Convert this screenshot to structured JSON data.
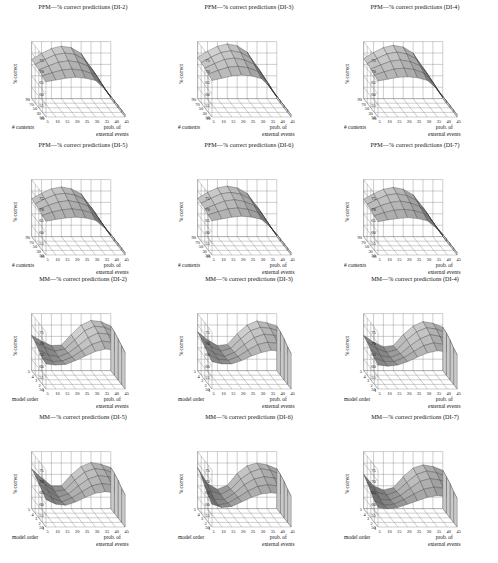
{
  "figure": {
    "kind": "3d-surface-grid",
    "rows": 4,
    "cols": 3,
    "background": "#ffffff",
    "ink": "#111111"
  },
  "axes_common": {
    "zlabel": "% correct",
    "xlabel_line1": "prob. of",
    "xlabel_line2": "external events",
    "z_ticks": [
      50,
      55,
      60,
      65,
      70,
      75
    ],
    "z_min": 50,
    "z_max": 75,
    "x_ticks": [
      5,
      10,
      15,
      20,
      25,
      30,
      35,
      40,
      45
    ],
    "pfm_depth_label": "# contexts",
    "pfm_depth_ticks": [
      90,
      70,
      50,
      30,
      10
    ],
    "mm_depth_label": "model order",
    "mm_depth_ticks": [
      5,
      4,
      3,
      2,
      1
    ]
  },
  "chart_data": [
    {
      "id": "pfm-di2",
      "type": "surface",
      "title": "PFM—% correct predictions (DI-2)",
      "model": "PFM",
      "dataset": "DI-2",
      "xlabel": "prob. of external events",
      "ylabel": "# contexts",
      "zlabel": "% correct",
      "x": [
        5,
        10,
        15,
        20,
        25,
        30,
        35,
        40,
        45
      ],
      "y": [
        10,
        30,
        50,
        70,
        90
      ],
      "zlim": [
        50,
        75
      ],
      "z": [
        [
          65.5,
          66.2,
          67.0,
          67.4,
          67.0,
          66.0,
          62.0,
          56.0,
          51.0
        ],
        [
          66.0,
          67.4,
          68.6,
          69.0,
          68.4,
          67.0,
          62.5,
          56.0,
          51.0
        ],
        [
          66.6,
          68.4,
          70.0,
          70.6,
          70.0,
          68.2,
          63.0,
          56.2,
          51.0
        ],
        [
          67.0,
          69.2,
          71.2,
          72.0,
          71.4,
          69.0,
          63.4,
          56.4,
          51.0
        ],
        [
          67.2,
          69.8,
          72.0,
          73.0,
          72.4,
          69.8,
          63.6,
          56.4,
          51.0
        ]
      ]
    },
    {
      "id": "pfm-di3",
      "type": "surface",
      "title": "PFM—% correct predictions (DI-3)",
      "model": "PFM",
      "dataset": "DI-3",
      "xlabel": "prob. of external events",
      "ylabel": "# contexts",
      "zlabel": "% correct",
      "x": [
        5,
        10,
        15,
        20,
        25,
        30,
        35,
        40,
        45
      ],
      "y": [
        10,
        30,
        50,
        70,
        90
      ],
      "zlim": [
        50,
        75
      ],
      "z": [
        [
          66.0,
          67.0,
          68.0,
          68.4,
          68.0,
          66.8,
          62.6,
          56.2,
          51.0
        ],
        [
          66.8,
          68.4,
          69.8,
          70.2,
          69.6,
          68.0,
          63.0,
          56.2,
          51.0
        ],
        [
          67.4,
          69.4,
          71.2,
          71.8,
          71.0,
          69.0,
          63.4,
          56.4,
          51.0
        ],
        [
          67.8,
          70.2,
          72.2,
          73.0,
          72.2,
          69.8,
          63.8,
          56.6,
          51.0
        ],
        [
          68.0,
          70.8,
          73.0,
          74.0,
          73.2,
          70.4,
          64.0,
          56.6,
          51.0
        ]
      ]
    },
    {
      "id": "pfm-di4",
      "type": "surface",
      "title": "PFM—% correct predictions (DI-4)",
      "model": "PFM",
      "dataset": "DI-4",
      "xlabel": "prob. of external events",
      "ylabel": "# contexts",
      "zlabel": "% correct",
      "x": [
        5,
        10,
        15,
        20,
        25,
        30,
        35,
        40,
        45
      ],
      "y": [
        10,
        30,
        50,
        70,
        90
      ],
      "zlim": [
        50,
        75
      ],
      "z": [
        [
          65.8,
          66.6,
          67.4,
          67.6,
          67.2,
          66.0,
          62.2,
          56.0,
          51.0
        ],
        [
          66.4,
          67.8,
          69.0,
          69.4,
          68.8,
          67.2,
          62.6,
          56.0,
          51.0
        ],
        [
          67.0,
          68.8,
          70.4,
          71.0,
          70.2,
          68.4,
          63.0,
          56.2,
          51.0
        ],
        [
          67.4,
          69.6,
          71.6,
          72.4,
          71.6,
          69.2,
          63.4,
          56.4,
          51.0
        ],
        [
          67.6,
          70.2,
          72.4,
          73.4,
          72.6,
          70.0,
          63.6,
          56.4,
          51.0
        ]
      ]
    },
    {
      "id": "pfm-di5",
      "type": "surface",
      "title": "PFM—% correct predictions (DI-5)",
      "model": "PFM",
      "dataset": "DI-5",
      "xlabel": "prob. of external events",
      "ylabel": "# contexts",
      "zlabel": "% correct",
      "x": [
        5,
        10,
        15,
        20,
        25,
        30,
        35,
        40,
        45
      ],
      "y": [
        10,
        30,
        50,
        70,
        90
      ],
      "zlim": [
        50,
        75
      ],
      "z": [
        [
          64.8,
          65.6,
          66.2,
          66.6,
          66.2,
          65.2,
          61.6,
          55.8,
          51.0
        ],
        [
          65.4,
          66.8,
          67.8,
          68.2,
          67.6,
          66.4,
          62.0,
          56.0,
          51.0
        ],
        [
          66.0,
          67.8,
          69.2,
          69.8,
          69.0,
          67.4,
          62.4,
          56.0,
          51.0
        ],
        [
          66.4,
          68.6,
          70.4,
          71.0,
          70.2,
          68.2,
          62.8,
          56.2,
          51.0
        ],
        [
          66.6,
          69.0,
          71.0,
          71.8,
          71.0,
          68.8,
          63.0,
          56.2,
          51.0
        ]
      ]
    },
    {
      "id": "pfm-di6",
      "type": "surface",
      "title": "PFM—% correct predictions (DI-6)",
      "model": "PFM",
      "dataset": "DI-6",
      "xlabel": "prob. of external events",
      "ylabel": "# contexts",
      "zlabel": "% correct",
      "x": [
        5,
        10,
        15,
        20,
        25,
        30,
        35,
        40,
        45
      ],
      "y": [
        10,
        30,
        50,
        70,
        90
      ],
      "zlim": [
        50,
        75
      ],
      "z": [
        [
          65.0,
          65.8,
          66.6,
          67.0,
          66.6,
          65.6,
          61.8,
          55.8,
          51.0
        ],
        [
          65.6,
          67.0,
          68.2,
          68.6,
          68.0,
          66.6,
          62.2,
          56.0,
          51.0
        ],
        [
          66.2,
          68.0,
          69.6,
          70.2,
          69.4,
          67.6,
          62.6,
          56.0,
          51.0
        ],
        [
          66.6,
          68.8,
          70.8,
          71.4,
          70.6,
          68.4,
          63.0,
          56.2,
          51.0
        ],
        [
          66.8,
          69.4,
          71.4,
          72.2,
          71.4,
          69.0,
          63.2,
          56.2,
          51.0
        ]
      ]
    },
    {
      "id": "pfm-di7",
      "type": "surface",
      "title": "PFM—% correct predictions (DI-7)",
      "model": "PFM",
      "dataset": "DI-7",
      "xlabel": "prob. of external events",
      "ylabel": "# contexts",
      "zlabel": "% correct",
      "x": [
        5,
        10,
        15,
        20,
        25,
        30,
        35,
        40,
        45
      ],
      "y": [
        10,
        30,
        50,
        70,
        90
      ],
      "zlim": [
        50,
        75
      ],
      "z": [
        [
          64.6,
          65.4,
          66.0,
          66.4,
          66.0,
          65.0,
          61.4,
          55.6,
          51.0
        ],
        [
          65.2,
          66.6,
          67.6,
          68.0,
          67.4,
          66.2,
          61.8,
          55.8,
          51.0
        ],
        [
          65.8,
          67.6,
          69.0,
          69.6,
          68.8,
          67.0,
          62.2,
          56.0,
          51.0
        ],
        [
          66.2,
          68.4,
          70.2,
          70.8,
          70.0,
          67.8,
          62.6,
          56.0,
          51.0
        ],
        [
          66.4,
          68.8,
          70.8,
          71.6,
          70.8,
          68.4,
          62.8,
          56.2,
          51.0
        ]
      ]
    },
    {
      "id": "mm-di2",
      "type": "surface",
      "title": "MM—% correct predictions (DI-2)",
      "model": "MM",
      "dataset": "DI-2",
      "xlabel": "prob. of external events",
      "ylabel": "model order",
      "zlabel": "% correct",
      "x": [
        5,
        10,
        15,
        20,
        25,
        30,
        35,
        40,
        45
      ],
      "y": [
        1,
        2,
        3,
        4,
        5
      ],
      "zlim": [
        50,
        75
      ],
      "z": [
        [
          61.0,
          60.5,
          60.8,
          62.5,
          64.5,
          66.5,
          67.5,
          67.0,
          66.0
        ],
        [
          61.5,
          60.0,
          60.2,
          62.0,
          64.8,
          67.5,
          69.0,
          68.5,
          67.0
        ],
        [
          63.0,
          60.8,
          60.0,
          61.8,
          65.0,
          68.5,
          70.5,
          70.0,
          68.0
        ],
        [
          64.5,
          62.0,
          60.5,
          61.5,
          65.5,
          69.5,
          71.5,
          71.0,
          69.0
        ],
        [
          65.5,
          63.0,
          61.0,
          61.2,
          65.8,
          70.0,
          72.0,
          71.5,
          69.5
        ]
      ]
    },
    {
      "id": "mm-di3",
      "type": "surface",
      "title": "MM—% correct predictions (DI-3)",
      "model": "MM",
      "dataset": "DI-3",
      "xlabel": "prob. of external events",
      "ylabel": "model order",
      "zlabel": "% correct",
      "x": [
        5,
        10,
        15,
        20,
        25,
        30,
        35,
        40,
        45
      ],
      "y": [
        1,
        2,
        3,
        4,
        5
      ],
      "zlim": [
        50,
        75
      ],
      "z": [
        [
          62.0,
          61.0,
          61.0,
          62.5,
          64.5,
          66.0,
          67.0,
          66.5,
          65.5
        ],
        [
          63.0,
          61.0,
          60.5,
          62.2,
          65.0,
          67.5,
          68.5,
          68.0,
          66.5
        ],
        [
          64.5,
          61.5,
          60.2,
          62.0,
          65.5,
          68.5,
          70.0,
          69.5,
          68.0
        ],
        [
          66.0,
          62.5,
          60.5,
          61.8,
          66.0,
          69.5,
          71.0,
          70.5,
          69.0
        ],
        [
          67.0,
          63.5,
          61.0,
          61.5,
          66.2,
          70.0,
          71.8,
          71.0,
          69.5
        ]
      ]
    },
    {
      "id": "mm-di4",
      "type": "surface",
      "title": "MM—% correct predictions (DI-4)",
      "model": "MM",
      "dataset": "DI-4",
      "xlabel": "prob. of external events",
      "ylabel": "model order",
      "zlabel": "% correct",
      "x": [
        5,
        10,
        15,
        20,
        25,
        30,
        35,
        40,
        45
      ],
      "y": [
        1,
        2,
        3,
        4,
        5
      ],
      "zlim": [
        50,
        75
      ],
      "z": [
        [
          60.5,
          60.0,
          60.5,
          62.0,
          64.0,
          65.8,
          66.8,
          66.2,
          65.0
        ],
        [
          61.5,
          60.0,
          60.0,
          61.8,
          64.5,
          67.0,
          68.2,
          67.5,
          66.0
        ],
        [
          63.0,
          60.5,
          59.8,
          61.5,
          65.0,
          68.0,
          69.8,
          69.0,
          67.5
        ],
        [
          64.5,
          61.5,
          60.0,
          61.2,
          65.5,
          69.0,
          70.8,
          70.2,
          68.5
        ],
        [
          65.5,
          62.5,
          60.5,
          61.0,
          65.8,
          69.5,
          71.5,
          70.8,
          69.0
        ]
      ]
    },
    {
      "id": "mm-di5",
      "type": "surface",
      "title": "MM—% correct predictions (DI-5)",
      "model": "MM",
      "dataset": "DI-5",
      "xlabel": "prob. of external events",
      "ylabel": "model order",
      "zlabel": "% correct",
      "x": [
        5,
        10,
        15,
        20,
        25,
        30,
        35,
        40,
        45
      ],
      "y": [
        1,
        2,
        3,
        4,
        5
      ],
      "zlim": [
        50,
        75
      ],
      "z": [
        [
          62.0,
          60.0,
          59.5,
          61.0,
          63.0,
          64.8,
          65.5,
          65.0,
          64.0
        ],
        [
          63.5,
          60.5,
          59.0,
          60.8,
          63.5,
          66.0,
          67.0,
          66.5,
          65.0
        ],
        [
          65.0,
          61.5,
          59.0,
          60.5,
          64.0,
          67.0,
          68.5,
          68.0,
          66.5
        ],
        [
          66.5,
          62.5,
          59.5,
          60.2,
          64.5,
          68.0,
          69.5,
          69.0,
          67.5
        ],
        [
          67.5,
          63.5,
          60.0,
          60.0,
          64.8,
          68.5,
          70.2,
          69.5,
          68.0
        ]
      ]
    },
    {
      "id": "mm-di6",
      "type": "surface",
      "title": "MM—% correct predictions (DI-6)",
      "model": "MM",
      "dataset": "DI-6",
      "xlabel": "prob. of external events",
      "ylabel": "model order",
      "zlabel": "% correct",
      "x": [
        5,
        10,
        15,
        20,
        25,
        30,
        35,
        40,
        45
      ],
      "y": [
        1,
        2,
        3,
        4,
        5
      ],
      "zlim": [
        50,
        75
      ],
      "z": [
        [
          60.0,
          58.5,
          59.0,
          61.0,
          63.0,
          64.5,
          65.0,
          64.5,
          63.5
        ],
        [
          61.5,
          57.5,
          58.5,
          61.0,
          63.8,
          65.8,
          66.5,
          66.0,
          64.5
        ],
        [
          64.0,
          58.0,
          58.0,
          60.8,
          64.5,
          67.0,
          68.0,
          67.5,
          66.0
        ],
        [
          66.5,
          59.5,
          58.2,
          60.5,
          65.0,
          68.0,
          69.5,
          68.8,
          67.0
        ],
        [
          68.0,
          61.0,
          58.5,
          60.2,
          65.5,
          68.8,
          70.0,
          69.2,
          67.5
        ]
      ]
    },
    {
      "id": "mm-di7",
      "type": "surface",
      "title": "MM—% correct predictions (DI-7)",
      "model": "MM",
      "dataset": "DI-7",
      "xlabel": "prob. of external events",
      "ylabel": "model order",
      "zlabel": "% correct",
      "x": [
        5,
        10,
        15,
        20,
        25,
        30,
        35,
        40,
        45
      ],
      "y": [
        1,
        2,
        3,
        4,
        5
      ],
      "zlim": [
        50,
        75
      ],
      "z": [
        [
          58.5,
          58.0,
          58.5,
          60.0,
          61.5,
          63.0,
          63.8,
          63.2,
          62.5
        ],
        [
          59.5,
          57.5,
          58.0,
          60.0,
          62.5,
          64.5,
          65.5,
          65.0,
          63.5
        ],
        [
          61.5,
          58.0,
          57.8,
          59.8,
          63.0,
          66.0,
          67.2,
          66.5,
          65.0
        ],
        [
          63.5,
          59.0,
          58.0,
          59.5,
          63.5,
          67.0,
          68.5,
          67.8,
          66.0
        ],
        [
          65.0,
          60.0,
          58.2,
          59.2,
          64.0,
          67.8,
          69.2,
          68.5,
          66.8
        ]
      ]
    }
  ]
}
